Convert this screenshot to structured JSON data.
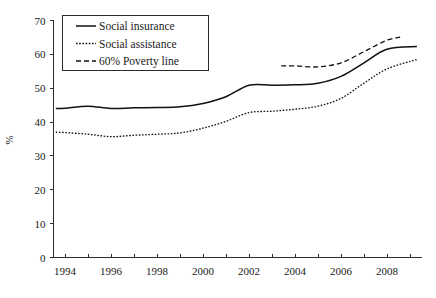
{
  "chart_data": {
    "type": "line",
    "title": "",
    "xlabel": "",
    "ylabel": "%",
    "xlim": [
      1993.5,
      2009.5
    ],
    "ylim": [
      0,
      70
    ],
    "grid": false,
    "legend_position": "top-left",
    "x_ticks_major": [
      "1994",
      "1996",
      "1998",
      "2000",
      "2002",
      "2004",
      "2006",
      "2008"
    ],
    "x_ticks_major_values": [
      1994,
      1996,
      1998,
      2000,
      2002,
      2004,
      2006,
      2008
    ],
    "x_ticks_minor_values": [
      1995,
      1997,
      1999,
      2001,
      2003,
      2005,
      2007,
      2009
    ],
    "y_ticks": [
      "0",
      "10",
      "20",
      "30",
      "40",
      "50",
      "60",
      "70"
    ],
    "y_tick_values": [
      0,
      10,
      20,
      30,
      40,
      50,
      60,
      70
    ],
    "series": [
      {
        "name": "Social insurance",
        "style": "solid",
        "color": "#111111",
        "x": [
          1993.6,
          1994,
          1995,
          1996,
          1997,
          1998,
          1999,
          2000,
          2001,
          2002,
          2003,
          2004,
          2005,
          2006,
          2007,
          2008,
          2009.3
        ],
        "values": [
          44.0,
          44.1,
          44.7,
          44.0,
          44.2,
          44.3,
          44.5,
          45.5,
          47.5,
          50.9,
          50.9,
          51.0,
          51.5,
          53.5,
          57.5,
          61.5,
          62.3
        ]
      },
      {
        "name": "Social assistance",
        "style": "dotted",
        "color": "#111111",
        "x": [
          1993.6,
          1994,
          1995,
          1996,
          1997,
          1998,
          1999,
          2000,
          2001,
          2002,
          2003,
          2004,
          2005,
          2006,
          2007,
          2008,
          2009.3
        ],
        "values": [
          37.0,
          36.9,
          36.4,
          35.7,
          36.1,
          36.4,
          36.8,
          38.2,
          40.2,
          42.8,
          43.2,
          43.8,
          44.7,
          47.0,
          51.5,
          55.7,
          58.5
        ]
      },
      {
        "name": "60% Poverty line",
        "style": "dashed",
        "color": "#111111",
        "x": [
          2003.4,
          2004,
          2005,
          2006,
          2007,
          2008,
          2008.7
        ],
        "values": [
          56.6,
          56.6,
          56.3,
          57.5,
          60.8,
          64.2,
          65.2
        ]
      }
    ]
  },
  "legend": {
    "items": [
      {
        "label": "Social insurance",
        "marker": "solid-line-marker"
      },
      {
        "label": "Social assistance",
        "marker": "dotted-line-marker"
      },
      {
        "label": "60% Poverty line",
        "marker": "dashed-line-marker"
      }
    ]
  }
}
